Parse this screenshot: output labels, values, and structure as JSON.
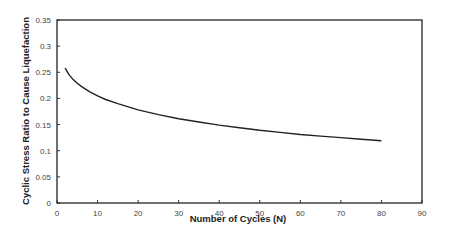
{
  "chart_data": {
    "type": "line",
    "title": "",
    "xlabel": "Number of Cycles (N)",
    "ylabel": "Cyclic Stress Ratio to Cause Liquefaction",
    "xlim": [
      0,
      90
    ],
    "ylim": [
      0,
      0.35
    ],
    "xticks": [
      "0",
      "10",
      "20",
      "30",
      "40",
      "50",
      "60",
      "70",
      "80",
      "90"
    ],
    "yticks": [
      "0",
      "0.05",
      "0.1",
      "0.15",
      "0.2",
      "0.25",
      "0.3",
      "0.35"
    ],
    "grid": false,
    "legend": null,
    "series": [
      {
        "name": "CSR",
        "x": [
          2,
          3,
          4,
          5,
          6,
          8,
          10,
          12,
          15,
          20,
          25,
          30,
          35,
          40,
          45,
          50,
          55,
          60,
          65,
          70,
          75,
          80
        ],
        "values": [
          0.258,
          0.245,
          0.236,
          0.229,
          0.223,
          0.213,
          0.205,
          0.198,
          0.19,
          0.178,
          0.169,
          0.161,
          0.155,
          0.149,
          0.144,
          0.139,
          0.135,
          0.131,
          0.128,
          0.125,
          0.122,
          0.119
        ]
      }
    ]
  }
}
